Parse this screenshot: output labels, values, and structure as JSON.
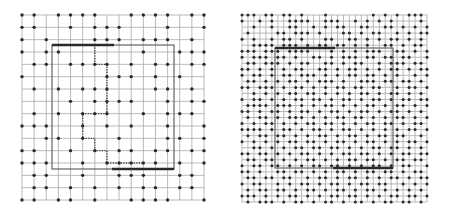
{
  "figure": {
    "panels": [
      {
        "id": "left",
        "grid": {
          "cols": 16,
          "rows": 16,
          "x0": 22,
          "y0": 15,
          "x1": 204,
          "y1": 200
        },
        "dot_rows": [
          "1101111001111011",
          "1100101110001001",
          "1010001110111010",
          "1011000000100111",
          "0110111101011011",
          "1000000111010100",
          "0101011100011010",
          "0000101111001011",
          "0101011100101110",
          "1110010101001001",
          "0011010010001101",
          "1100101011011011",
          "1110010111110101",
          "0110010011100110",
          "0110101010110110",
          "1101101001111001"
        ],
        "frame": {
          "x": 52,
          "y": 45,
          "w": 122,
          "h": 124
        },
        "top_bar": {
          "x1": 52,
          "x2": 114,
          "y": 45
        },
        "bottom_bar": {
          "x1": 112,
          "x2": 174,
          "y": 169
        },
        "dotted_path": [
          [
            6,
            -0.5
          ],
          [
            6,
            4
          ],
          [
            7,
            4
          ],
          [
            7,
            8
          ],
          [
            5,
            8
          ],
          [
            5,
            10
          ],
          [
            6,
            10
          ],
          [
            6,
            11
          ],
          [
            7,
            11
          ],
          [
            7,
            12
          ],
          [
            10,
            12
          ]
        ]
      },
      {
        "id": "right",
        "grid": {
          "cols": 32,
          "rows": 32,
          "x0": 242,
          "y0": 15,
          "x1": 427,
          "y1": 202
        },
        "dot_rows": [
          "11101101101000100000001010101110",
          "10010100111100111001010101000010",
          "00100100110010101100110011010101",
          "01000011011101000110101100101011",
          "10100101101000110011010101101010",
          "00111101110101101101010011010110",
          "11101110111100010101011100110101",
          "10111011010011010111011011011001",
          "01101110101100110101100101110110",
          "11010101011001101011010101101011",
          "10110101101110101011011010100101",
          "01101010110101110100111011011010",
          "11011101011010101101101100101101",
          "00101010110110101010110101101010",
          "10110101011011010110101101011011",
          "01111011101010110101011010110101",
          "11010110101101011010110101101010",
          "01011010111010101101101010110101",
          "10101101010110110101011011010110",
          "11110101101011010110101010101101",
          "01011011010101101011010110110010",
          "10101010110110101101011010101101",
          "00110101011011011010101101101010",
          "11011010101101010110110101011011",
          "01101101010110101011011010110110",
          "10110110101011011010101101011001",
          "11010011011010101101011011010110",
          "01101101100101101011010101101011",
          "10110010101101011010110110010101",
          "01011011010110101101011010101010",
          "11101010110101011011010101101101",
          "01011101011010110101101011011010"
        ],
        "frame": {
          "x": 275,
          "y": 48,
          "w": 118,
          "h": 120
        },
        "top_bar": {
          "x1": 275,
          "x2": 335,
          "y": 48
        },
        "bottom_bar": {
          "x1": 333,
          "x2": 393,
          "y": 168
        }
      }
    ]
  }
}
